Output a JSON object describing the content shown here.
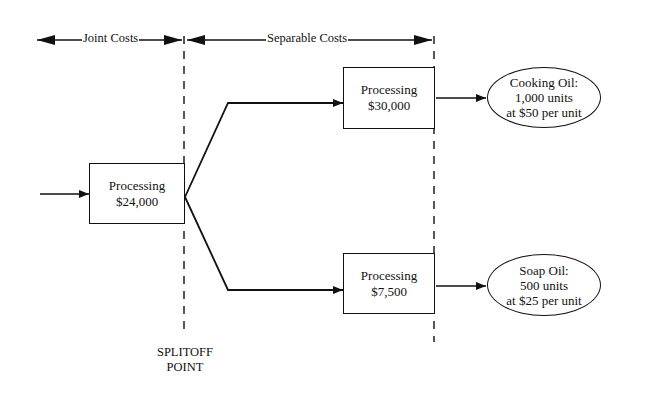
{
  "header": {
    "joint_costs_label": "Joint Costs",
    "separable_costs_label": "Separable Costs"
  },
  "joint_process": {
    "label": "Processing",
    "cost": "$24,000"
  },
  "products": [
    {
      "process": {
        "label": "Processing",
        "cost": "$30,000"
      },
      "output": {
        "name": "Cooking Oil:",
        "quantity": "1,000 units",
        "price": "at $50 per unit"
      }
    },
    {
      "process": {
        "label": "Processing",
        "cost": "$7,500"
      },
      "output": {
        "name": "Soap Oil:",
        "quantity": "500 units",
        "price": "at $25 per unit"
      }
    }
  ],
  "splitoff": {
    "line1": "SPLITOFF",
    "line2": "POINT"
  }
}
